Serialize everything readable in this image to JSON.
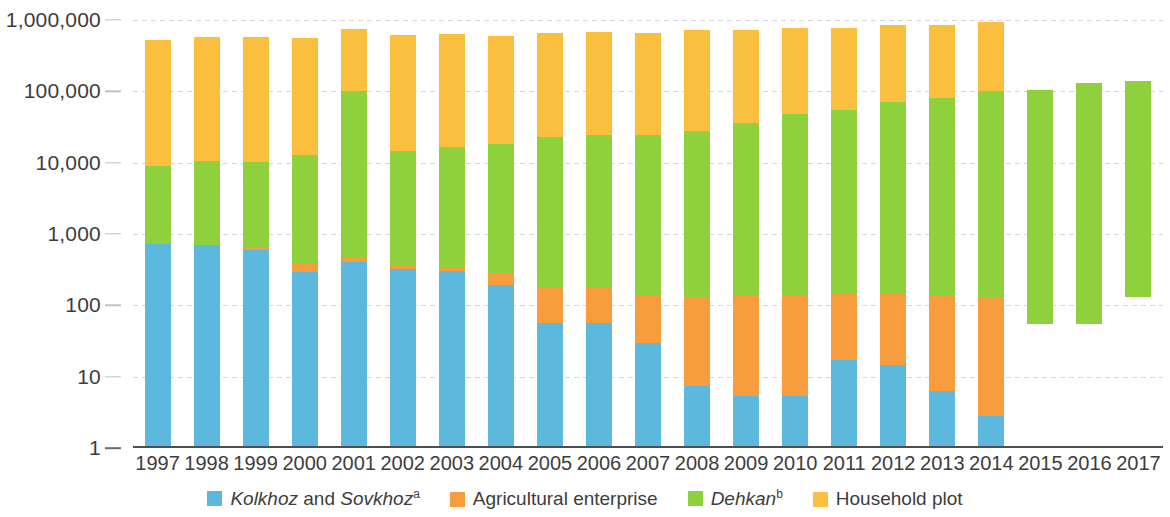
{
  "chart_data": {
    "type": "bar",
    "stacked": true,
    "title": "",
    "xlabel": "",
    "ylabel": "",
    "yscale": "log",
    "ylim": [
      1,
      1000000
    ],
    "grid": true,
    "legend_position": "bottom",
    "y_ticks": [
      "1",
      "10",
      "100",
      "1,000",
      "10,000",
      "100,000",
      "1,000,000"
    ],
    "y_tick_values": [
      1,
      10,
      100,
      1000,
      10000,
      100000,
      1000000
    ],
    "categories": [
      "1997",
      "1998",
      "1999",
      "2000",
      "2001",
      "2002",
      "2003",
      "2004",
      "2005",
      "2006",
      "2007",
      "2008",
      "2009",
      "2010",
      "2011",
      "2012",
      "2013",
      "2014",
      "2015",
      "2016",
      "2017"
    ],
    "series": [
      {
        "name": "Kolkhoz and Sovkhoz",
        "name_italic": "Kolkhoz and Sovkhoz",
        "footnote": "a",
        "color": "#5cb8dc",
        "values": [
          720,
          710,
          600,
          290,
          400,
          320,
          300,
          190,
          57,
          57,
          30,
          7.5,
          5.3,
          5.3,
          17,
          14.5,
          6.3,
          2.8,
          null,
          null,
          null
        ]
      },
      {
        "name": "Agricultural enterprise",
        "footnote": "",
        "color": "#f89d3e",
        "values": [
          0,
          0,
          40,
          90,
          80,
          50,
          40,
          85,
          120,
          120,
          110,
          125,
          130,
          130,
          125,
          130,
          130,
          130,
          null,
          null,
          null
        ]
      },
      {
        "name": "Dehkan",
        "name_italic": "Dehkan",
        "footnote": "b",
        "color": "#8ed13d",
        "values": [
          8300,
          10000,
          9500,
          12600,
          100000,
          14000,
          16000,
          18000,
          23000,
          24000,
          24000,
          28000,
          36000,
          48000,
          55000,
          70000,
          80000,
          100000,
          105000,
          130000,
          140000
        ]
      },
      {
        "name": "Household plot",
        "footnote": "",
        "color": "#fabf3e",
        "values": [
          520000,
          570000,
          570000,
          550000,
          650000,
          600000,
          610000,
          580000,
          640000,
          650000,
          640000,
          700000,
          690000,
          730000,
          720000,
          780000,
          770000,
          830000,
          null,
          null,
          null
        ]
      }
    ],
    "notes": {
      "floating_bars": "2015-2017 show only the Dehkan series, drawn as floating bars with lower bounds 55, 55 and 130 respectively.",
      "floating_bounds": [
        {
          "year": "2015",
          "low": 55,
          "high": 105000
        },
        {
          "year": "2016",
          "low": 55,
          "high": 130000
        },
        {
          "year": "2017",
          "low": 130,
          "high": 140000
        }
      ]
    }
  },
  "legend": {
    "items": [
      {
        "label_italic": "Kolkhoz",
        "label_plain": " and ",
        "label_italic2": "Sovkhoz",
        "sup": "a",
        "color": "#5cb8dc",
        "icon": "legend-swatch-blue"
      },
      {
        "label_plain_only": "Agricultural enterprise",
        "color": "#f89d3e",
        "icon": "legend-swatch-orange"
      },
      {
        "label_italic": "Dehkan",
        "sup": "b",
        "color": "#8ed13d",
        "icon": "legend-swatch-green"
      },
      {
        "label_plain_only": "Household plot",
        "color": "#fabf3e",
        "icon": "legend-swatch-yellow"
      }
    ]
  }
}
